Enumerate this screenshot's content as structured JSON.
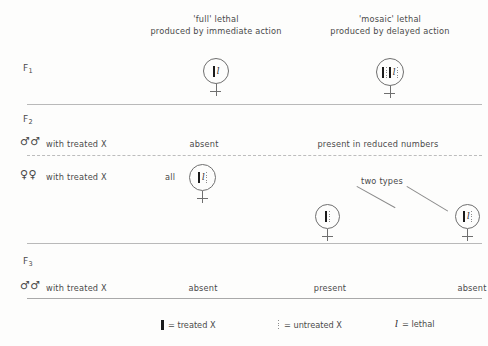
{
  "diagram": {
    "columns": [
      {
        "id": "full",
        "heading_line1": "'full' lethal",
        "heading_line2": "produced by immediate action"
      },
      {
        "id": "mosaic",
        "heading_line1": "'mosaic' lethal",
        "heading_line2": "produced by delayed action"
      }
    ],
    "generations": [
      {
        "id": "f1",
        "label": "F",
        "subscript": "1"
      },
      {
        "id": "f2",
        "label": "F",
        "subscript": "2"
      },
      {
        "id": "f3",
        "label": "F",
        "subscript": "3"
      }
    ],
    "f1": {
      "full_individual_sex": "female",
      "mosaic_individual_sex": "female"
    },
    "f2": {
      "males_row_label": "with treated X",
      "males_sex_symbol": "♂♂",
      "males_full_result": "absent",
      "males_mosaic_result": "present in reduced numbers",
      "females_row_label": "with treated X",
      "females_sex_symbol": "♀♀",
      "females_full_qualifier": "all",
      "females_mosaic_note": "two types"
    },
    "f3": {
      "males_row_label": "with treated X",
      "males_sex_symbol": "♂♂",
      "results": [
        "absent",
        "present",
        "absent"
      ]
    },
    "legend": [
      {
        "symbol": "treated-x-bar",
        "text": "= treated X"
      },
      {
        "symbol": "untreated-x-bar",
        "text": "= untreated X"
      },
      {
        "symbol": "lethal-italic-l",
        "text": "= lethal"
      }
    ],
    "colors": {
      "ink": "#4a4a4a",
      "rule": "#b9b9b9",
      "chromosome_treated": "#1a1a1a",
      "chromosome_untreated": "#8d8d8d",
      "background": "#fdfdfc"
    }
  }
}
